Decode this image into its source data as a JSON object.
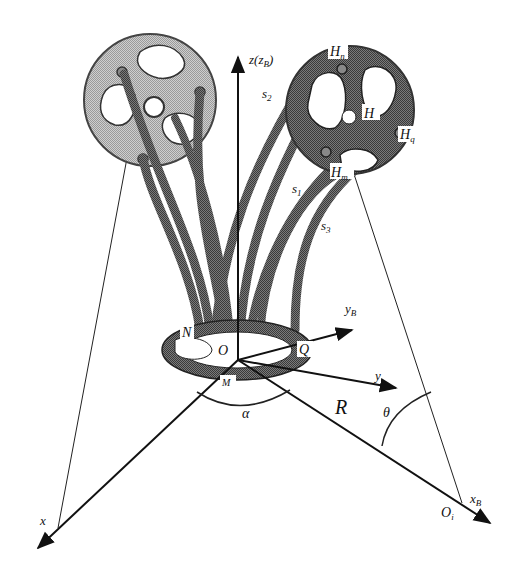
{
  "diagram": {
    "type": "3D kinematic schematic — continuum robot with base ring and two end-effector discs",
    "labels": {
      "z_axis": "z(z",
      "z_axis_sub": "B",
      "z_axis_close": ")",
      "s2": "s",
      "s2_sub": "2",
      "s1": "s",
      "s1_sub": "1",
      "s3": "s",
      "s3_sub": "3",
      "Hn": "H",
      "Hn_sub": "n",
      "H": "H",
      "Hq": "H",
      "Hq_sub": "q",
      "Hm": "H",
      "Hm_sub": "m",
      "yB": "y",
      "yB_sub": "B",
      "y": "y",
      "N": "N",
      "O": "O",
      "Q": "Q",
      "M": "M",
      "alpha": "α",
      "R": "R",
      "theta": "θ",
      "x": "x",
      "xB": "x",
      "xB_sub": "B",
      "Oi": "O",
      "Oi_sub": "i"
    },
    "colors": {
      "line": "#1a1a1a",
      "disc_light": "#bdbdbd",
      "disc_dark": "#5a5a5a",
      "tube": "#6a6a6a",
      "background": "#ffffff"
    }
  }
}
